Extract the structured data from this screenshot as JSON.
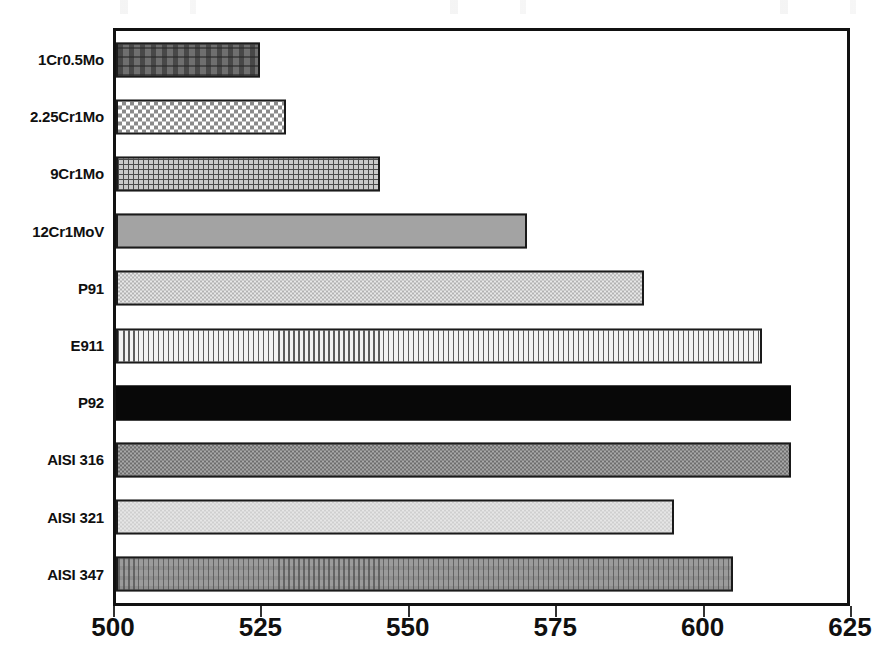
{
  "chart_data": {
    "type": "bar",
    "orientation": "horizontal",
    "title": "",
    "subtitle": "",
    "xlabel": "",
    "ylabel": "",
    "xlim": [
      500,
      625
    ],
    "ylim": null,
    "grid": false,
    "legend": null,
    "xticks": [
      500,
      525,
      550,
      575,
      600,
      625
    ],
    "xtick_labels": [
      "500",
      "525",
      "550",
      "575",
      "600",
      "625"
    ],
    "categories": [
      "1Cr0.5Mo",
      "2.25Cr1Mo",
      "9Cr1Mo",
      "12Cr1MoV",
      "P91",
      "E911",
      "P92",
      "AISI 316",
      "AISI 321",
      "AISI 347"
    ],
    "values": [
      524.5,
      529,
      545,
      570,
      590,
      610,
      615,
      615,
      595,
      605
    ],
    "bar_patterns": [
      "dark-gray-dashed",
      "checkerboard",
      "fine-grid",
      "solid-medium-gray",
      "light-gray-dotted",
      "vertical-stripes",
      "solid-black",
      "medium-gray-dotted",
      "very-light-gray",
      "medium-gray-vertical-dashes"
    ],
    "bar_colors": [
      "#6f6f6f",
      "#e9e9e9",
      "#c9c9c9",
      "#a3a3a3",
      "#d4d4d4",
      "#e4e4e4",
      "#080808",
      "#8e8e8e",
      "#d9d9d9",
      "#9b9b9b"
    ],
    "axis_color": "#111111",
    "text_color": "#101010"
  }
}
